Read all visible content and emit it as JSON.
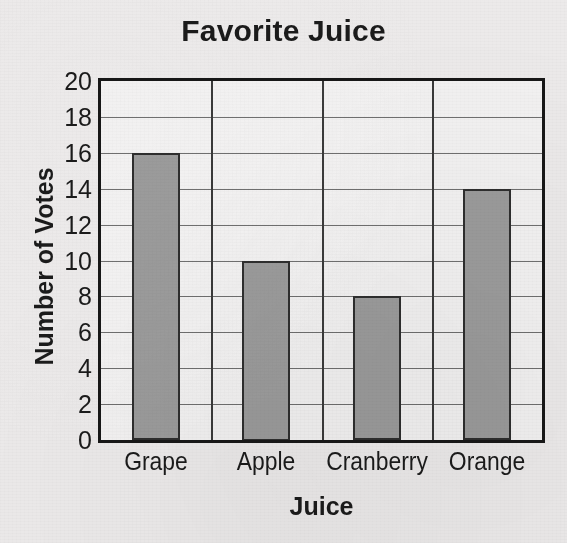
{
  "chart_data": {
    "type": "bar",
    "title": "Favorite Juice",
    "xlabel": "Juice",
    "ylabel": "Number of Votes",
    "categories": [
      "Grape",
      "Apple",
      "Cranberry",
      "Orange"
    ],
    "values": [
      16,
      10,
      8,
      14
    ],
    "ylim": [
      0,
      20
    ],
    "ytick_step": 2,
    "yticks": [
      "20",
      "18",
      "16",
      "14",
      "12",
      "10",
      "8",
      "6",
      "4",
      "2",
      "0"
    ],
    "grid": "horizontal-and-vertical",
    "legend": "none",
    "bar_fill_color": "#9b9b9b",
    "bar_border_color": "#2e2e2e",
    "axis_color": "#171717",
    "gridline_color": "#6f6f6f",
    "background_color": "#eceaea",
    "plot_background_color": "#f2f1f1"
  }
}
